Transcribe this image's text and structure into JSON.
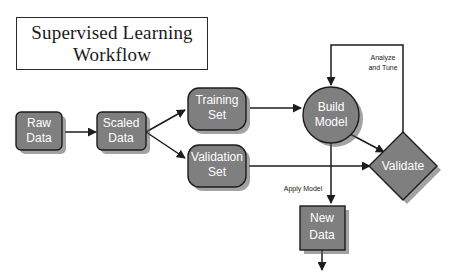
{
  "title": {
    "line1": "Supervised Learning",
    "line2": "Workflow"
  },
  "colors": {
    "node_fill": "#7f7f7f",
    "node_stroke": "#1c1c1c",
    "node_text": "#ffffff",
    "background": "#ffffff",
    "title_text": "#1a1a1a"
  },
  "nodes": [
    {
      "id": "raw-data",
      "shape": "rounded-rect",
      "line1": "Raw",
      "line2": "Data"
    },
    {
      "id": "scaled-data",
      "shape": "rounded-rect",
      "line1": "Scaled",
      "line2": "Data"
    },
    {
      "id": "training-set",
      "shape": "rounded-rect",
      "line1": "Training",
      "line2": "Set"
    },
    {
      "id": "validation-set",
      "shape": "rounded-rect",
      "line1": "Validation",
      "line2": "Set"
    },
    {
      "id": "build-model",
      "shape": "circle",
      "line1": "Build",
      "line2": "Model"
    },
    {
      "id": "validate",
      "shape": "diamond",
      "line1": "Validate",
      "line2": ""
    },
    {
      "id": "new-data",
      "shape": "rect",
      "line1": "New",
      "line2": "Data"
    }
  ],
  "edge_labels": {
    "analyze_tune_line1": "Analyze",
    "analyze_tune_line2": "and Tune",
    "apply_model": "Apply Model"
  }
}
